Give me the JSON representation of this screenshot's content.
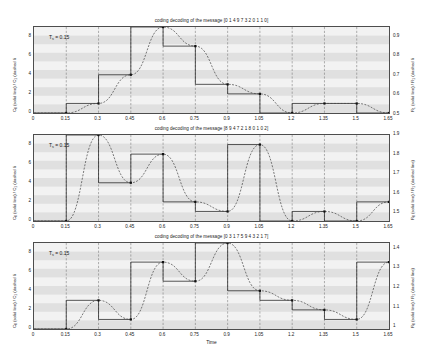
{
  "figure": {
    "xlabel": "Time",
    "ts_note_html": "T_s = 0.15",
    "ts_label": "T",
    "ts_sub": "s",
    "ts_value": " = 0.15"
  },
  "chart_data": [
    {
      "type": "line",
      "title": "coding decoding of the message [0 1 4 9 7 3 2 0 1 1 0]",
      "xlabel": "",
      "ylabel": "C_0 (solid line) / C_1 (dashed li",
      "ylabel_left": "C_0 (solid line) / C_1 (dashed li",
      "ylabel_right": "R_1 (solid line) / R_1 (dashed li",
      "xlim": [
        0,
        1.65
      ],
      "ylim": [
        0,
        9
      ],
      "xticks": [
        0,
        0.15,
        0.3,
        0.45,
        0.6,
        0.75,
        0.9,
        1.05,
        1.2,
        1.35,
        1.5,
        1.65
      ],
      "xticklabels": [
        "0",
        "0.15",
        "0.3",
        "0.45",
        "0.6",
        "0.75",
        "0.9",
        "1.05",
        "1.2",
        "1.35",
        "1.5",
        "1.65"
      ],
      "yticks": [
        0,
        2,
        4,
        6,
        8
      ],
      "yticklabels": [
        "0",
        "2",
        "4",
        "6",
        "8"
      ],
      "y2lim": [
        0.5,
        0.95
      ],
      "y2ticks": [
        0.5,
        0.6,
        0.7,
        0.8,
        0.9
      ],
      "y2ticklabels": [
        "0.5",
        "0.6",
        "0.7",
        "0.8",
        "0.9"
      ],
      "message": [
        0,
        1,
        4,
        9,
        7,
        3,
        2,
        0,
        1,
        1,
        0
      ],
      "grid": true,
      "legend": "none",
      "series": [
        {
          "name": "C_0 (solid line)",
          "style": "step",
          "values": [
            0,
            1,
            4,
            9,
            7,
            3,
            2,
            0,
            1,
            1,
            0
          ]
        },
        {
          "name": "C_1 (dashed line)",
          "style": "smooth",
          "values": [
            0,
            1,
            4,
            9,
            7,
            3,
            2,
            0,
            1,
            1,
            0
          ]
        }
      ]
    },
    {
      "type": "line",
      "title": "coding decoding of the message [8 9 4 7 2 1 8 0 1 0 2]",
      "xlabel": "",
      "ylabel_left": "C_0 (solid line) / C_1 (dashed lin",
      "ylabel_right": "R_0 (solid line) / R_1 (dashed line)",
      "xlim": [
        0,
        1.65
      ],
      "ylim": [
        0,
        9
      ],
      "xticks": [
        0,
        0.15,
        0.3,
        0.45,
        0.6,
        0.75,
        0.9,
        1.05,
        1.2,
        1.35,
        1.5,
        1.65
      ],
      "xticklabels": [
        "0",
        "0.15",
        "0.3",
        "0.45",
        "0.6",
        "0.75",
        "0.9",
        "1.05",
        "1.2",
        "1.35",
        "1.5",
        "1.65"
      ],
      "yticks": [
        0,
        2,
        4,
        6,
        8
      ],
      "yticklabels": [
        "0",
        "2",
        "4",
        "6",
        "8"
      ],
      "y2lim": [
        1.45,
        1.9
      ],
      "y2ticks": [
        1.5,
        1.6,
        1.7,
        1.8,
        1.9
      ],
      "y2ticklabels": [
        "1.5",
        "1.6",
        "1.7",
        "1.8",
        "1.9"
      ],
      "message": [
        0,
        9,
        4,
        7,
        2,
        1,
        8,
        0,
        1,
        0,
        2
      ],
      "grid": true,
      "legend": "none",
      "series": [
        {
          "name": "C_0 (solid line)",
          "style": "step",
          "values": [
            0,
            9,
            4,
            7,
            2,
            1,
            8,
            0,
            1,
            0,
            2
          ]
        },
        {
          "name": "C_1 (dashed line)",
          "style": "smooth",
          "values": [
            0,
            9,
            4,
            7,
            2,
            1,
            8,
            0,
            1,
            0,
            2
          ]
        }
      ]
    },
    {
      "type": "line",
      "title": "coding decoding of the message [0 3 1 7 5 9 4 3 2 1 7]",
      "xlabel": "Time",
      "ylabel_left": "C_0 (solid line) / C_1 (dashed lin",
      "ylabel_right": "R_0 (solid line) / R_1 (dashed line)",
      "xlim": [
        0,
        1.65
      ],
      "ylim": [
        0,
        9
      ],
      "xticks": [
        0,
        0.15,
        0.3,
        0.45,
        0.6,
        0.75,
        0.9,
        1.05,
        1.2,
        1.35,
        1.5,
        1.65
      ],
      "xticklabels": [
        "0",
        "0.15",
        "0.3",
        "0.45",
        "0.6",
        "0.75",
        "0.9",
        "1.05",
        "1.2",
        "1.35",
        "1.5",
        "1.65"
      ],
      "yticks": [
        0,
        2,
        4,
        6,
        8
      ],
      "yticklabels": [
        "0",
        "2",
        "4",
        "6",
        "8"
      ],
      "y2lim": [
        0.98,
        1.43
      ],
      "y2ticks": [
        1,
        1.1,
        1.2,
        1.3,
        1.4
      ],
      "y2ticklabels": [
        "1",
        "1.1",
        "1.2",
        "1.3",
        "1.4"
      ],
      "message": [
        0,
        3,
        1,
        7,
        5,
        9,
        4,
        3,
        2,
        1,
        7
      ],
      "grid": true,
      "legend": "none",
      "series": [
        {
          "name": "C_0 (solid line)",
          "style": "step",
          "values": [
            0,
            3,
            1,
            7,
            5,
            9,
            4,
            3,
            2,
            1,
            7
          ]
        },
        {
          "name": "C_1 (dashed line)",
          "style": "smooth",
          "values": [
            0,
            3,
            1,
            7,
            5,
            9,
            4,
            3,
            2,
            1,
            7
          ]
        }
      ]
    }
  ]
}
